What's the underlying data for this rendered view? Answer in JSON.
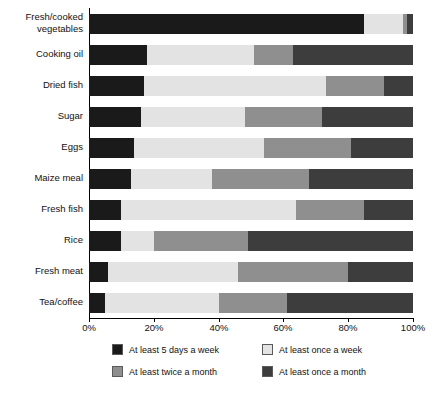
{
  "chart_data": {
    "type": "bar",
    "subtype": "stacked-horizontal-100-percent",
    "title": "",
    "xlabel": "",
    "ylabel": "",
    "xlim": [
      0,
      100
    ],
    "xticks": [
      0,
      20,
      40,
      60,
      80,
      100
    ],
    "xticklabels": [
      "0%",
      "20%",
      "40%",
      "60%",
      "80%",
      "100%"
    ],
    "grid": false,
    "legend_position": "bottom",
    "categories": [
      "Fresh/cooked\nvegetables",
      "Cooking oil",
      "Dried fish",
      "Sugar",
      "Eggs",
      "Maize meal",
      "Fresh fish",
      "Rice",
      "Fresh meat",
      "Tea/coffee"
    ],
    "series": [
      {
        "name": "At least 5 days a week",
        "color": "#1a1a1a",
        "values": [
          85,
          18,
          17,
          16,
          14,
          13,
          10,
          10,
          6,
          5
        ]
      },
      {
        "name": "At least once a week",
        "color": "#e3e3e3",
        "values": [
          12,
          33,
          56,
          32,
          40,
          25,
          54,
          10,
          40,
          35
        ]
      },
      {
        "name": "At least twice a month",
        "color": "#8f8f8f",
        "values": [
          1,
          12,
          18,
          24,
          27,
          30,
          21,
          29,
          34,
          21
        ]
      },
      {
        "name": "At least once a month",
        "color": "#3d3d3d",
        "values": [
          2,
          37,
          9,
          28,
          19,
          32,
          15,
          51,
          20,
          39
        ]
      }
    ]
  },
  "legend": {
    "items": [
      {
        "label": "At least 5 days a week",
        "color": "#1a1a1a"
      },
      {
        "label": "At least once a week",
        "color": "#e3e3e3"
      },
      {
        "label": "At least twice a month",
        "color": "#8f8f8f"
      },
      {
        "label": "At least once a month",
        "color": "#3d3d3d"
      }
    ]
  }
}
